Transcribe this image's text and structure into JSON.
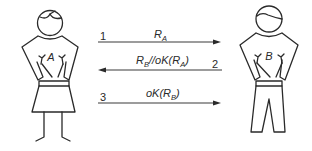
{
  "diagram": {
    "type": "authentication-protocol",
    "actors": [
      {
        "id": "A",
        "label": "A",
        "depiction": "woman-figure-with-skirt"
      },
      {
        "id": "B",
        "label": "B",
        "depiction": "man-figure-with-trousers"
      }
    ],
    "messages": [
      {
        "step": "1",
        "from": "A",
        "to": "B",
        "text": "R",
        "subscript": "A",
        "suffix": ""
      },
      {
        "step": "2",
        "from": "B",
        "to": "A",
        "text": "R",
        "subscript": "B",
        "mid": "//oK(R",
        "subscript2": "A",
        "suffix": ")"
      },
      {
        "step": "3",
        "from": "A",
        "to": "B",
        "text": "oK(R",
        "subscript": "B",
        "suffix": ")"
      }
    ]
  }
}
